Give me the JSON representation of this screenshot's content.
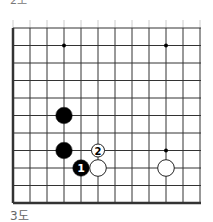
{
  "diagram": {
    "type": "go-board-fragment",
    "caption_top_partial": "2도",
    "caption": "3도",
    "grid": {
      "columns": 12,
      "rows": 11,
      "thick_edges": [
        "left",
        "bottom"
      ]
    },
    "star_points": [
      {
        "col": 3,
        "row": 1
      },
      {
        "col": 9,
        "row": 1
      },
      {
        "col": 9,
        "row": 7
      }
    ],
    "stones": [
      {
        "color": "black",
        "col": 3,
        "row": 5,
        "label": ""
      },
      {
        "color": "black",
        "col": 3,
        "row": 7,
        "label": ""
      },
      {
        "color": "black",
        "col": 4,
        "row": 8,
        "label": "1"
      },
      {
        "color": "white",
        "col": 5,
        "row": 8,
        "label": ""
      },
      {
        "color": "white",
        "col": 5,
        "row": 7,
        "label": "2",
        "small": true
      },
      {
        "color": "white",
        "col": 9,
        "row": 8,
        "label": ""
      }
    ],
    "colors": {
      "line": "#333333",
      "black_stone": "#000000",
      "white_stone": "#ffffff",
      "stone_outline": "#222222"
    }
  }
}
